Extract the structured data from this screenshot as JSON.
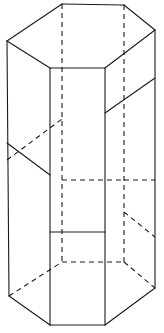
{
  "figure": {
    "description": "Wireframe line drawing of a tall hexagonal prism shown in oblique projection, with hidden edges drawn as dashed lines and a set of horizontal and diagonal cut lines wrapping the lateral surface.",
    "canvas": {
      "width": 164,
      "height": 333
    },
    "style": {
      "background_color": "#ffffff",
      "line_color": "#1a1a1a",
      "line_width": 1.1,
      "hidden_line_dash": "5 4"
    },
    "vertices": {
      "top": {
        "front_left": [
          50,
          68
        ],
        "front_right": [
          105,
          68
        ],
        "right": [
          155,
          30
        ],
        "back_right": [
          124,
          5
        ],
        "back_left": [
          62,
          4
        ],
        "left": [
          7,
          41
        ]
      },
      "bottom": {
        "front_left": [
          50,
          325
        ],
        "front_right": [
          105,
          325
        ],
        "right": [
          155,
          288
        ],
        "back_right": [
          124,
          262
        ],
        "back_left": [
          62,
          262
        ],
        "left": [
          9,
          296
        ]
      }
    },
    "edges": {
      "top_face_visible": [
        "left -> back_left",
        "back_left -> back_right",
        "back_right -> right",
        "right -> front_right",
        "front_right -> front_left",
        "front_left -> left"
      ],
      "vertical_visible": [
        "left",
        "front_left",
        "front_right",
        "right"
      ],
      "vertical_hidden": [
        "back_left",
        "back_right"
      ],
      "bottom_face_visible": [
        "left -> front_left",
        "front_left -> front_right",
        "front_right -> right"
      ],
      "bottom_face_hidden": [
        "left -> back_left",
        "back_left -> back_right",
        "back_right -> right"
      ]
    },
    "cut_lines": [
      {
        "name": "upper-right-diagonal",
        "type": "solid",
        "from": [
          105,
          113
        ],
        "to": [
          155,
          78
        ]
      },
      {
        "name": "upper-left-diagonal",
        "type": "solid",
        "from": [
          7,
          143
        ],
        "to": [
          50,
          175
        ]
      },
      {
        "name": "upper-left-hidden-diagonal",
        "type": "hidden",
        "from": [
          7,
          160
        ],
        "to": [
          62,
          119
        ]
      },
      {
        "name": "mid-back-horizontal",
        "type": "hidden",
        "from": [
          62,
          180
        ],
        "to": [
          124,
          180
        ]
      },
      {
        "name": "mid-right-hidden",
        "type": "hidden",
        "from": [
          124,
          180
        ],
        "to": [
          155,
          180
        ]
      },
      {
        "name": "lower-front-horizontal",
        "type": "solid",
        "from": [
          50,
          232
        ],
        "to": [
          105,
          232
        ]
      },
      {
        "name": "lower-right-diagonal",
        "type": "hidden",
        "from": [
          124,
          212
        ],
        "to": [
          155,
          237
        ]
      }
    ],
    "segment_count": {
      "solid_segments": 17,
      "dashed_segments": 9
    }
  }
}
